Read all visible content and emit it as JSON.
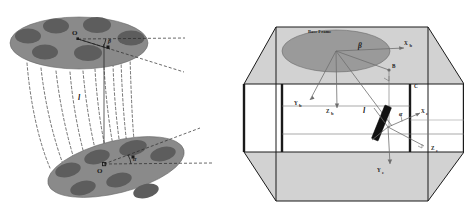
{
  "figure": {
    "caption": "",
    "panels": [
      {
        "id": "left",
        "name": "two-platform-cable-schematic",
        "labels": {
          "origin_upper": "O",
          "origin_lower": "O",
          "angle_upper": "β",
          "angle_lower": "α",
          "length": "l"
        }
      },
      {
        "id": "right",
        "name": "workspace-box-frames",
        "labels": {
          "base_frame": "Base Frame",
          "x_base": "X",
          "x_base_sub": "b",
          "y_base": "Y",
          "y_base_sub": "b",
          "z_base": "Z",
          "z_base_sub": "b",
          "x_end": "X",
          "x_end_sub": "e",
          "y_end": "Y",
          "y_end_sub": "e",
          "z_end": "Z",
          "z_end_sub": "e",
          "point_b": "B",
          "point_c": "C",
          "angle_beta": "β",
          "angle_alpha": "α",
          "length": "l"
        }
      }
    ]
  },
  "colors": {
    "platform_fill": "#8a8a8a",
    "hole_fill": "#5f5f5f",
    "plane_fill": "#d2d2d2",
    "ellipse_fill": "#9a9a9a",
    "line": "#1a1a1a",
    "thin_line": "#6e6e6e",
    "effector_fill": "#111111",
    "background": "#ffffff"
  }
}
